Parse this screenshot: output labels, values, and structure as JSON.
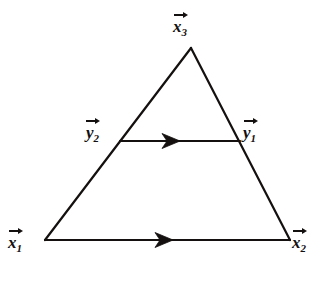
{
  "figure": {
    "kind": "geometry-diagram",
    "background_color": "#ffffff",
    "ink_color": "#14100f",
    "stroke_width": 2,
    "canvas": {
      "width": 323,
      "height": 284
    },
    "vertices": [
      {
        "id": "x1",
        "x": 45,
        "y": 240,
        "label_letter": "x",
        "label_sub": "1",
        "vector": true
      },
      {
        "id": "x2",
        "x": 290,
        "y": 240,
        "label_letter": "x",
        "label_sub": "2",
        "vector": true
      },
      {
        "id": "x3",
        "x": 191,
        "y": 48,
        "label_letter": "x",
        "label_sub": "3",
        "vector": true
      }
    ],
    "midline": {
      "from": {
        "id": "y2",
        "x": 120,
        "y": 141,
        "label_letter": "y",
        "label_sub": "2",
        "vector": true
      },
      "to": {
        "id": "y1",
        "x": 240,
        "y": 141,
        "label_letter": "y",
        "label_sub": "1",
        "vector": true
      },
      "arrow_direction": "right",
      "arrow_at_x": 175
    },
    "base": {
      "from": "x1",
      "to": "x2",
      "arrow_direction": "right",
      "arrow_at_x": 168
    },
    "edges": [
      {
        "from": "x1",
        "to": "x3"
      },
      {
        "from": "x3",
        "to": "x2"
      },
      {
        "from": "x1",
        "to": "x2"
      }
    ],
    "labels": {
      "x3": {
        "letter": "x",
        "sub": "3"
      },
      "y2": {
        "letter": "y",
        "sub": "2"
      },
      "y1": {
        "letter": "y",
        "sub": "1"
      },
      "x1": {
        "letter": "x",
        "sub": "1"
      },
      "x2": {
        "letter": "x",
        "sub": "2"
      }
    }
  }
}
